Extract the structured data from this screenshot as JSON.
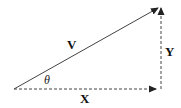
{
  "diagram": {
    "type": "vector-decomposition",
    "vector_label": "V",
    "x_component_label": "X",
    "y_component_label": "Y",
    "angle_label": "θ",
    "colors": {
      "line": "#333333",
      "text": "#111111",
      "background": "#ffffff"
    }
  }
}
